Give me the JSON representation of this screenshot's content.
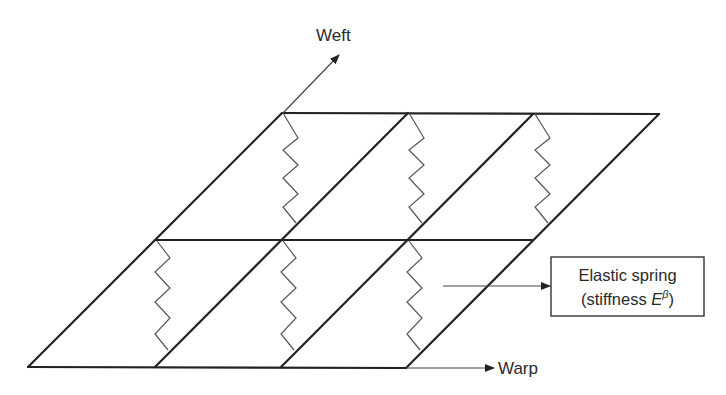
{
  "diagram": {
    "type": "fabric-spring-lattice",
    "axes": {
      "weft": {
        "label": "Weft"
      },
      "warp": {
        "label": "Warp"
      }
    },
    "callout": {
      "line1": "Elastic spring",
      "line2_prefix": "(stiffness ",
      "line2_symbol": "E",
      "line2_superscript": "β",
      "line2_suffix": ")"
    },
    "grid": {
      "rows": 2,
      "columns": 3,
      "springs_per_cell": 1
    },
    "colors": {
      "frame": "#222222",
      "spring": "#555555",
      "background": "#ffffff"
    }
  }
}
